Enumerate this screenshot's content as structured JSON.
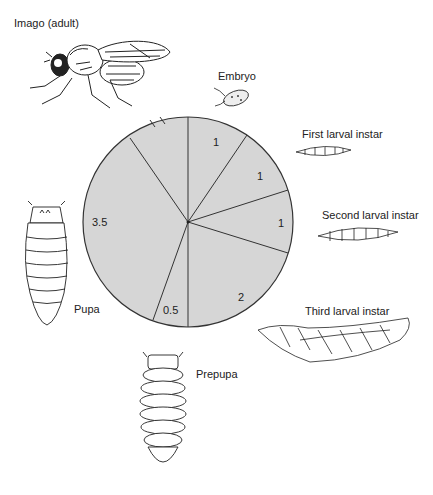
{
  "diagram": {
    "stages": [
      {
        "name": "Imago (adult)",
        "icon": "adult-fly-icon"
      },
      {
        "name": "Embryo",
        "icon": "embryo-icon"
      },
      {
        "name": "First larval instar",
        "icon": "first-larva-icon"
      },
      {
        "name": "Second larval instar",
        "icon": "second-larva-icon"
      },
      {
        "name": "Third larval instar",
        "icon": "third-larva-icon"
      },
      {
        "name": "Prepupa",
        "icon": "prepupa-icon"
      },
      {
        "name": "Pupa",
        "icon": "pupa-icon"
      }
    ],
    "pie": {
      "fill": "#d6d6d6",
      "stroke": "#333333",
      "slices": [
        {
          "stage": "Embryo",
          "label": "1"
        },
        {
          "stage": "First larval instar",
          "label": "1"
        },
        {
          "stage": "Second larval instar",
          "label": "1"
        },
        {
          "stage": "Third larval instar",
          "label": "2"
        },
        {
          "stage": "Prepupa",
          "label": "0.5"
        },
        {
          "stage": "Pupa",
          "label": "3.5"
        },
        {
          "stage": "Imago (adult)",
          "label": ""
        }
      ]
    }
  }
}
